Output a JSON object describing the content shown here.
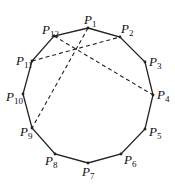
{
  "diagram": {
    "type": "regular-12-gon",
    "vertices": [
      {
        "id": "P1",
        "base": "P",
        "sub": "1",
        "x": 88,
        "y": 28,
        "lx": 84,
        "ly": 24
      },
      {
        "id": "P2",
        "base": "P",
        "sub": "2",
        "x": 120,
        "y": 37,
        "lx": 121,
        "ly": 33
      },
      {
        "id": "P3",
        "base": "P",
        "sub": "3",
        "x": 145,
        "y": 62,
        "lx": 149,
        "ly": 66
      },
      {
        "id": "P4",
        "base": "P",
        "sub": "4",
        "x": 153,
        "y": 95,
        "lx": 157,
        "ly": 99
      },
      {
        "id": "P5",
        "base": "P",
        "sub": "5",
        "x": 145,
        "y": 129,
        "lx": 149,
        "ly": 136
      },
      {
        "id": "P6",
        "base": "P",
        "sub": "6",
        "x": 121,
        "y": 154,
        "lx": 124,
        "ly": 164
      },
      {
        "id": "P7",
        "base": "P",
        "sub": "7",
        "x": 88,
        "y": 163,
        "lx": 82,
        "ly": 176
      },
      {
        "id": "P8",
        "base": "P",
        "sub": "8",
        "x": 55,
        "y": 154,
        "lx": 45,
        "ly": 165
      },
      {
        "id": "P9",
        "base": "P",
        "sub": "9",
        "x": 32,
        "y": 128,
        "lx": 20,
        "ly": 136
      },
      {
        "id": "P10",
        "base": "P",
        "sub": "10",
        "x": 23,
        "y": 94,
        "lx": 6,
        "ly": 101
      },
      {
        "id": "P11",
        "base": "P",
        "sub": "11",
        "x": 32,
        "y": 61,
        "lx": 16,
        "ly": 65
      },
      {
        "id": "P12",
        "base": "P",
        "sub": "12",
        "x": 54,
        "y": 36,
        "lx": 42,
        "ly": 34
      }
    ],
    "dashed_segments": [
      {
        "from": "P1",
        "to": "P9"
      },
      {
        "from": "P11",
        "to": "P2"
      },
      {
        "from": "P12",
        "to": "P4"
      }
    ]
  }
}
